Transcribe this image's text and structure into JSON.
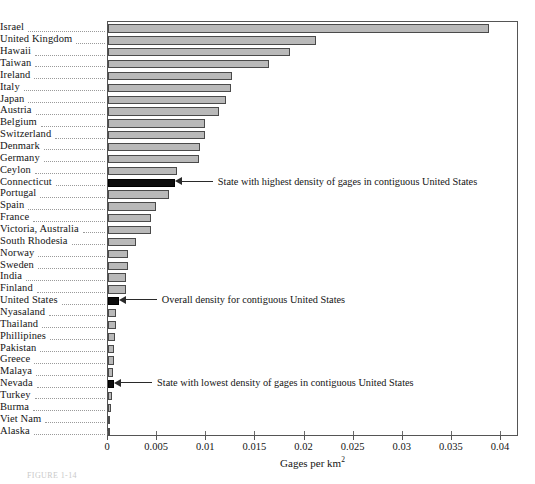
{
  "chart_data": {
    "type": "bar",
    "orientation": "horizontal",
    "title": "",
    "xlabel": "Gages per km2",
    "xlabel_html": "Gages per km",
    "xlabel_sup": "2",
    "ylabel": "",
    "xlim": [
      0,
      0.04
    ],
    "xticks": [
      0,
      0.005,
      0.01,
      0.015,
      0.02,
      0.025,
      0.03,
      0.035,
      0.04
    ],
    "xticklabels": [
      "0",
      "0.005",
      "0.01",
      "0.015",
      "0.02",
      "0.025",
      "0.03",
      "0.035",
      "0.04"
    ],
    "grid": false,
    "legend": "none",
    "categories": [
      "Israel",
      "United Kingdom",
      "Hawaii",
      "Taiwan",
      "Ireland",
      "Italy",
      "Japan",
      "Austria",
      "Belgium",
      "Switzerland",
      "Denmark",
      "Germany",
      "Ceylon",
      "Connecticut",
      "Portugal",
      "Spain",
      "France",
      "Victoria, Australia",
      "South Rhodesia",
      "Norway",
      "Sweden",
      "India",
      "Finland",
      "United States",
      "Nyasaland",
      "Thailand",
      "Phillipines",
      "Pakistan",
      "Greece",
      "Malaya",
      "Nevada",
      "Turkey",
      "Burma",
      "Viet Nam",
      "Alaska"
    ],
    "values": [
      0.0388,
      0.0212,
      0.0185,
      0.0164,
      0.0126,
      0.0125,
      0.012,
      0.0113,
      0.0099,
      0.0099,
      0.0094,
      0.0093,
      0.007,
      0.0068,
      0.0062,
      0.0049,
      0.0044,
      0.0044,
      0.0028,
      0.002,
      0.002,
      0.0018,
      0.0018,
      0.0011,
      0.00085,
      0.0008,
      0.00068,
      0.00065,
      0.00062,
      0.00052,
      0.00062,
      0.00038,
      0.00034,
      0.00022,
      0.00012
    ],
    "highlighted": [
      "Connecticut",
      "United States",
      "Nevada"
    ],
    "annotations": [
      {
        "category": "Connecticut",
        "text": "State with highest density of gages in contiguous United States"
      },
      {
        "category": "United States",
        "text": "Overall density for contiguous United States"
      },
      {
        "category": "Nevada",
        "text": "State with lowest density of gages in contiguous United States"
      }
    ],
    "colors": {
      "bar_fill": "#b9b9b9",
      "bar_edge": "#4a4a4a",
      "highlight_fill": "#0d0d0d",
      "axis": "#555555",
      "text": "#141414",
      "background": "#ffffff"
    }
  },
  "caption": {
    "text": "FIGURE 1-14"
  }
}
